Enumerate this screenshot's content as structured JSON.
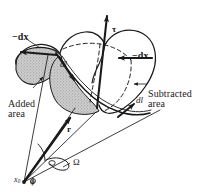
{
  "figure": {
    "background_color": "#ffffff",
    "ink_color": "#1a1a1a",
    "shade_color": "#b9b9b9",
    "width": 205,
    "height": 196
  },
  "labels": {
    "dx_left": "−dx",
    "dx_right": "−dx",
    "tau": "τ",
    "dl_upper": "dl",
    "dl_lower": "dl",
    "r_vector": "r",
    "omega": "Ω",
    "phi": "φ",
    "x0_symbol": "x",
    "x0_subscript": "0",
    "added_area": "Added\narea",
    "subtracted_area": "Subtracted\narea"
  },
  "annotations": [
    {
      "name": "dx-left-label",
      "text": "−dx",
      "x": 12,
      "y": 33
    },
    {
      "name": "dx-right-label",
      "text": "−dx",
      "x": 132,
      "y": 54
    },
    {
      "name": "tau-label",
      "text": "τ",
      "x": 113,
      "y": 27
    },
    {
      "name": "dl-upper-label",
      "text": "dl",
      "x": 61,
      "y": 62
    },
    {
      "name": "dl-lower-label",
      "text": "dl",
      "x": 136,
      "y": 98
    },
    {
      "name": "r-vector-label",
      "text": "r",
      "x": 67,
      "y": 127
    },
    {
      "name": "omega-label",
      "text": "Ω",
      "x": 72,
      "y": 160
    },
    {
      "name": "added-area-label",
      "text": "Added\narea",
      "x": 9,
      "y": 91
    },
    {
      "name": "subtracted-area-label",
      "text": "Subtracted\narea",
      "x": 148,
      "y": 82
    },
    {
      "name": "origin-label",
      "text": "x0",
      "x": 15,
      "y": 178
    },
    {
      "name": "phi-label",
      "text": "φ",
      "x": 32,
      "y": 180
    }
  ]
}
